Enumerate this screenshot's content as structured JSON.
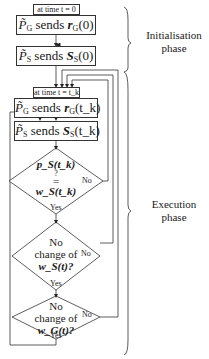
{
  "diagram": {
    "tag_init": "at time t = 0",
    "tag_exec": "at time t = t_k",
    "boxes": [
      {
        "id": "pg-init",
        "actor": "P̃",
        "actor_sub": "G",
        "verb": "sends",
        "signal": "r",
        "signal_sub": "G",
        "arg": "(0)"
      },
      {
        "id": "ps-init",
        "actor": "P̃",
        "actor_sub": "S",
        "verb": "sends",
        "signal": "S",
        "signal_sub": "S",
        "arg": "(0)"
      },
      {
        "id": "pg-exec",
        "actor": "P̃",
        "actor_sub": "G",
        "verb": "sends",
        "signal": "r",
        "signal_sub": "G",
        "arg": "(t_k)"
      },
      {
        "id": "ps-exec",
        "actor": "P̃",
        "actor_sub": "S",
        "verb": "sends",
        "signal": "S",
        "signal_sub": "S",
        "arg": "(t_k)"
      }
    ],
    "decisions": [
      {
        "id": "d1",
        "line1": "p_S(t_k)",
        "line2": "?",
        "line3": "=",
        "line4": "w_S(t_k)",
        "yes": "Yes",
        "no": "No"
      },
      {
        "id": "d2",
        "line1": "No",
        "line2": "change of",
        "line3": "w_S(t)?",
        "yes": "Yes",
        "no": "No"
      },
      {
        "id": "d3",
        "line1": "No",
        "line2": "change of",
        "line3": "w_G(t)?",
        "yes": "Yes",
        "no": "No"
      }
    ],
    "phases": [
      {
        "label_line1": "Initialisation",
        "label_line2": "phase"
      },
      {
        "label_line1": "Execution",
        "label_line2": "phase"
      }
    ]
  }
}
